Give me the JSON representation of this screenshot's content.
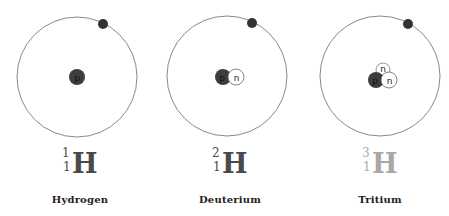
{
  "colors": {
    "orbit": "#8a8a8a",
    "electron": "#333333",
    "proton": "#3d3d3d",
    "neutron_fill": "#ffffff",
    "neutron_stroke": "#666666",
    "symbol_dark": "#4a4a4a",
    "symbol_light": "#a8a8a8"
  },
  "isotopes": [
    {
      "name": "Hydrogen",
      "symbol": "H",
      "mass_number": "1",
      "atomic_number": "1",
      "proton_label": "p",
      "neutron_labels": []
    },
    {
      "name": "Deuterium",
      "symbol": "H",
      "mass_number": "2",
      "atomic_number": "1",
      "proton_label": "p",
      "neutron_labels": [
        "n"
      ]
    },
    {
      "name": "Tritium",
      "symbol": "H",
      "mass_number": "3",
      "atomic_number": "1",
      "proton_label": "p",
      "neutron_labels": [
        "n",
        "n"
      ]
    }
  ]
}
